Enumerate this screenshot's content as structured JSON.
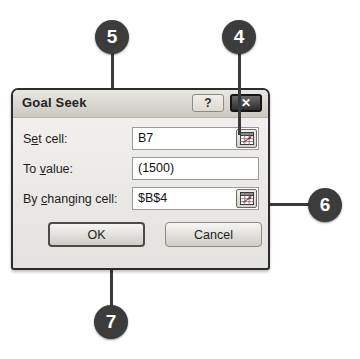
{
  "dialog": {
    "title": "Goal Seek",
    "titlebar_buttons": [
      {
        "name": "help",
        "label": "?"
      },
      {
        "name": "close",
        "label": "✕"
      }
    ],
    "fields": [
      {
        "label_pre": "S",
        "label_accel": "e",
        "label_post": "t cell:",
        "label_full": "Set cell:",
        "value": "B7",
        "has_collapse_button": true
      },
      {
        "label_pre": "To ",
        "label_accel": "v",
        "label_post": "alue:",
        "label_full": "To value:",
        "value": "(1500)",
        "has_collapse_button": false
      },
      {
        "label_pre": "By ",
        "label_accel": "c",
        "label_post": "hanging cell:",
        "label_full": "By changing cell:",
        "value": "$B$4",
        "has_collapse_button": true
      }
    ],
    "buttons": {
      "ok": "OK",
      "cancel": "Cancel"
    }
  },
  "callouts": [
    {
      "id": "callout-5",
      "number": "5",
      "target": "to-value-field"
    },
    {
      "id": "callout-4",
      "number": "4",
      "target": "set-cell-collapse-button"
    },
    {
      "id": "callout-6",
      "number": "6",
      "target": "by-changing-cell-collapse-button"
    },
    {
      "id": "callout-7",
      "number": "7",
      "target": "ok-button"
    }
  ],
  "colors": {
    "callout_fill": "#3c3c3c",
    "callout_text": "#ffffff",
    "leader_line": "#3a3a3a",
    "dialog_border": "#2b2b2b",
    "dialog_bg": "#ebe9e6",
    "titlebar_bg": "#dbd8d3",
    "close_button_bg": "#2e2e2e",
    "field_bg": "#ffffff",
    "page_bg": "#ffffff"
  }
}
